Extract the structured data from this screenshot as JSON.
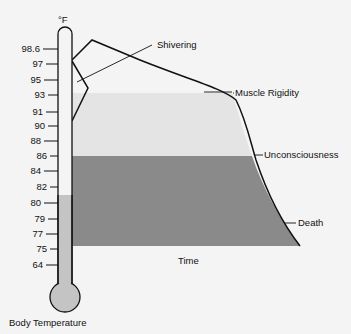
{
  "diagram": {
    "unit_label": "°F",
    "axis_title": "Body Temperature",
    "x_axis_label": "Time",
    "ticks": [
      "98.6",
      "97",
      "95",
      "93",
      "91",
      "90",
      "88",
      "86",
      "84",
      "82",
      "80",
      "79",
      "77",
      "75",
      "64"
    ],
    "annotations": {
      "shivering": "Shivering",
      "muscle_rigidity": "Muscle Rigidity",
      "unconsciousness": "Unconsciousness",
      "death": "Death"
    },
    "colors": {
      "background": "#f4f4f4",
      "light_band": "#e4e4e4",
      "dark_band": "#8c8c8c",
      "mercury": "#c4c4c4",
      "line": "#111111"
    }
  }
}
